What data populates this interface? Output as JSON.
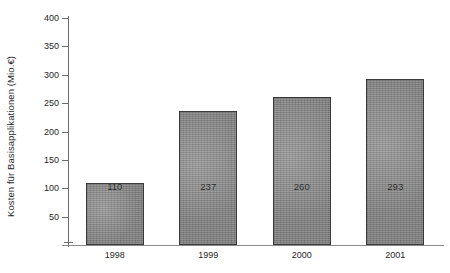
{
  "chart_data": {
    "type": "bar",
    "title": "",
    "subtitle": "",
    "xlabel": "",
    "ylabel": "Kosten für Basisapplikationen (Mio.€)",
    "categories": [
      "1998",
      "1999",
      "2000",
      "2001"
    ],
    "values": [
      110,
      237,
      260,
      293
    ],
    "data_labels": [
      "110",
      "237",
      "260",
      "293"
    ],
    "ylim": [
      0,
      400
    ],
    "ytick_labels": [
      "400",
      "350",
      "300",
      "250",
      "200",
      "150",
      "100",
      "50"
    ],
    "ytick_values": [
      400,
      350,
      300,
      250,
      200,
      150,
      100,
      50
    ],
    "grid": false,
    "legend": null,
    "legend_position": "none",
    "series": [
      {
        "name": "Kosten für Basisapplikationen (Mio.€)",
        "values": [
          110,
          237,
          260,
          293
        ]
      }
    ],
    "colors": {
      "bar_fill": "#8c8c8c",
      "bar_border": "#3a3a3a",
      "axis": "#6b6b6b",
      "text": "#1f1f1f",
      "background": "#ffffff"
    }
  }
}
